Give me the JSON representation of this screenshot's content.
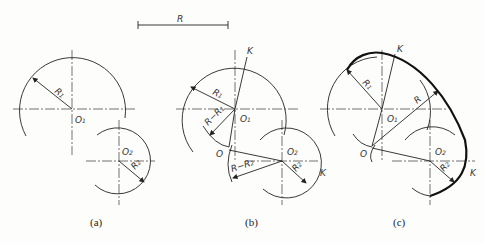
{
  "figure": {
    "scale_label": "R",
    "panels": [
      {
        "id": "a",
        "caption": "(a)",
        "labels": {
          "r1": "R",
          "r1_sub": "1",
          "o1": "O",
          "o1_sub": "1",
          "o2": "O",
          "o2_sub": "2",
          "r2": "R",
          "r2_sub": "2"
        }
      },
      {
        "id": "b",
        "caption": "(b)",
        "labels": {
          "k": "K",
          "r1": "R",
          "r1_sub": "1",
          "rr1": "R−R",
          "rr1_sub": "1",
          "o1": "O",
          "o1_sub": "1",
          "o": "O",
          "o2": "O",
          "o2_sub": "2",
          "rr2": "R−R",
          "rr2_sub": "2",
          "r2": "R",
          "r2_sub": "2",
          "k2": "K"
        }
      },
      {
        "id": "c",
        "caption": "(c)",
        "labels": {
          "k": "K",
          "r1": "R",
          "r1_sub": "1",
          "r": "R",
          "o1": "O",
          "o1_sub": "1",
          "o": "O",
          "o2": "O",
          "o2_sub": "2",
          "r2": "R",
          "r2_sub": "2",
          "k2": "K"
        }
      }
    ]
  }
}
